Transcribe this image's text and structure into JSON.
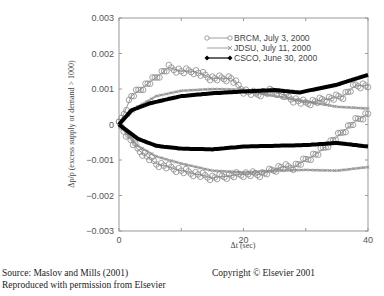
{
  "chart_data": {
    "type": "line",
    "title": "",
    "xlabel": "Δt (sec)",
    "ylabel": "Δp/p (excess supply or demand > 1000)",
    "xlim": [
      0,
      40
    ],
    "ylim": [
      -0.003,
      0.003
    ],
    "x_ticks": [
      0,
      20,
      40
    ],
    "x_tick_labels": [
      "0",
      "20",
      "40"
    ],
    "y_ticks": [
      0.003,
      0.002,
      0.001,
      0,
      -0.001,
      -0.002,
      -0.003
    ],
    "y_tick_labels": [
      "0.003",
      "0.002",
      "0.001",
      "0",
      "−0.001",
      "−0.002",
      "−0.003"
    ],
    "grid": false,
    "legend_position": "upper right (inside)",
    "series": [
      {
        "name": "BRCM, July 3, 2000",
        "marker": "open-circle",
        "color": "#888888",
        "branches": [
          {
            "side": "demand",
            "x": [
              0,
              2,
              5,
              8,
              10,
              12,
              15,
              18,
              20,
              22,
              25,
              28,
              30,
              33,
              36,
              38,
              40
            ],
            "y": [
              0,
              0.0008,
              0.0012,
              0.0016,
              0.0015,
              0.0015,
              0.0013,
              0.0013,
              0.00095,
              0.00085,
              0.00095,
              0.0007,
              0.0006,
              0.0007,
              0.0008,
              0.0011,
              0.0011
            ]
          },
          {
            "side": "supply",
            "x": [
              0,
              3,
              6,
              10,
              15,
              20,
              23,
              26,
              28,
              30,
              32,
              34,
              36,
              38,
              40
            ],
            "y": [
              0,
              -0.0007,
              -0.0011,
              -0.0013,
              -0.0015,
              -0.0014,
              -0.0014,
              -0.0012,
              -0.0012,
              -0.001,
              -0.0008,
              -0.0005,
              -0.0002,
              0.0001,
              0.0003
            ]
          }
        ]
      },
      {
        "name": "JDSU, July 11, 2000",
        "marker": "x",
        "color": "#9a9a9a",
        "branches": [
          {
            "side": "demand",
            "x": [
              0,
              3,
              6,
              10,
              15,
              20,
              25,
              30,
              35,
              40
            ],
            "y": [
              0,
              0.0005,
              0.0008,
              0.00095,
              0.001,
              0.00098,
              0.0008,
              0.00065,
              0.0005,
              0.00045
            ]
          },
          {
            "side": "supply",
            "x": [
              0,
              3,
              6,
              10,
              15,
              20,
              25,
              30,
              35,
              40
            ],
            "y": [
              0,
              -0.0006,
              -0.0009,
              -0.0011,
              -0.0013,
              -0.00135,
              -0.0013,
              -0.00128,
              -0.0013,
              -0.0012
            ]
          }
        ]
      },
      {
        "name": "CSCO, June 30, 2000",
        "marker": "filled-diamond",
        "color": "#000000",
        "branches": [
          {
            "side": "demand",
            "x": [
              0,
              2,
              5,
              10,
              15,
              20,
              25,
              29,
              30,
              35,
              40
            ],
            "y": [
              0,
              0.0004,
              0.0006,
              0.0008,
              0.00088,
              0.00093,
              0.00097,
              0.0009,
              0.00094,
              0.00112,
              0.0014
            ]
          },
          {
            "side": "supply",
            "x": [
              0,
              3,
              6,
              10,
              15,
              20,
              25,
              30,
              35,
              40
            ],
            "y": [
              0,
              -0.0004,
              -0.0006,
              -0.00068,
              -0.0007,
              -0.00062,
              -0.0006,
              -0.00058,
              -0.00052,
              -0.00062
            ]
          }
        ]
      }
    ]
  },
  "captions": {
    "source_line1": "Source: Maslov and Mills (2001)",
    "source_line2": "Reproduced with permission from Elsevier",
    "copyright": "Copyright © Elsevier 2001"
  }
}
